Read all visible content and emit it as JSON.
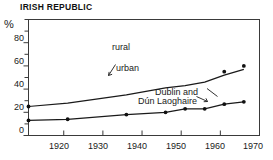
{
  "chart_data": {
    "type": "line",
    "title": "IRISH REPUBLIC",
    "xlabel": "",
    "ylabel": "%",
    "xlim": [
      1911,
      1970
    ],
    "ylim": [
      0,
      100
    ],
    "yticks": [
      0,
      20,
      40,
      60,
      80
    ],
    "ytick_minor_step": 10,
    "xticks": [
      1920,
      1930,
      1940,
      1950,
      1960,
      1970
    ],
    "grid": false,
    "legend_position": "inline-annotations",
    "annotations": [
      {
        "text": "rural",
        "x": 1936,
        "y": 80
      },
      {
        "text": "urban",
        "x": 1937,
        "y": 52,
        "pointer_to": {
          "x": 1934,
          "y": 43
        }
      },
      {
        "text": "Dublin and",
        "x": 1948,
        "y": 36
      },
      {
        "text": "Dún Laoghaire",
        "x": 1944,
        "y": 31,
        "pointer_to": {
          "x": 1956,
          "y": 26
        }
      }
    ],
    "series": [
      {
        "name": "urban",
        "x": [
          1911,
          1921,
          1936,
          1946,
          1951,
          1956,
          1961,
          1966
        ],
        "values": [
          25,
          28,
          35,
          41,
          43,
          46,
          52,
          57
        ],
        "markers": false
      },
      {
        "name": "Dublin and Dún Laoghaire",
        "x": [
          1911,
          1921,
          1936,
          1946,
          1951,
          1956,
          1961,
          1966
        ],
        "values": [
          13,
          14,
          18,
          20,
          23,
          23,
          27,
          29
        ],
        "markers": true
      }
    ],
    "marker_points": [
      {
        "series": "urban",
        "x": 1911,
        "y": 25
      },
      {
        "series": "urban",
        "x": 1961,
        "y": 55
      },
      {
        "series": "urban",
        "x": 1966,
        "y": 60
      },
      {
        "series": "Dublin and Dún Laoghaire",
        "x": 1911,
        "y": 13
      },
      {
        "series": "Dublin and Dún Laoghaire",
        "x": 1921,
        "y": 14
      },
      {
        "series": "Dublin and Dún Laoghaire",
        "x": 1936,
        "y": 18
      },
      {
        "series": "Dublin and Dún Laoghaire",
        "x": 1946,
        "y": 20
      },
      {
        "series": "Dublin and Dún Laoghaire",
        "x": 1951,
        "y": 23
      },
      {
        "series": "Dublin and Dún Laoghaire",
        "x": 1956,
        "y": 23
      },
      {
        "series": "Dublin and Dún Laoghaire",
        "x": 1961,
        "y": 27
      },
      {
        "series": "Dublin and Dún Laoghaire",
        "x": 1966,
        "y": 29
      }
    ],
    "colors": {
      "line": "#1a1a1a",
      "axis": "#444444",
      "text": "#1a1a1a",
      "background": "#ffffff"
    }
  },
  "axis": {
    "y_unit": "%",
    "yticks": [
      "80",
      "60",
      "40",
      "20",
      "0"
    ],
    "xticks": [
      "1920",
      "1930",
      "1940",
      "1950",
      "1960",
      "1970"
    ]
  },
  "labels": {
    "rural": "rural",
    "urban": "urban",
    "dublin_line1": "Dublin and",
    "dublin_line2": "Dún Laoghaire"
  }
}
